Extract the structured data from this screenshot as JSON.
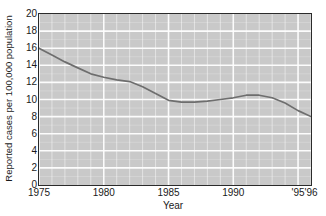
{
  "chart_data": {
    "type": "line",
    "title": "",
    "xlabel": "Year",
    "ylabel": "Reported cases per 100,000 population",
    "xlim": [
      1975,
      1996
    ],
    "ylim": [
      0,
      20
    ],
    "ytick_step": 2,
    "yticks": [
      "20",
      "18",
      "16",
      "14",
      "12",
      "10",
      "8",
      "6",
      "4",
      "2",
      "0"
    ],
    "ytick_values": [
      20,
      18,
      16,
      14,
      12,
      10,
      8,
      6,
      4,
      2,
      0
    ],
    "xticks": [
      {
        "label": "1975",
        "value": 1975
      },
      {
        "label": "1980",
        "value": 1980
      },
      {
        "label": "1985",
        "value": 1985
      },
      {
        "label": "1990",
        "value": 1990
      },
      {
        "label": "'95",
        "value": 1995
      },
      {
        "label": "'96",
        "value": 1996
      }
    ],
    "grid": "both-axes-white-minor-and-major",
    "legend": "none",
    "x": [
      1975,
      1976,
      1977,
      1978,
      1979,
      1980,
      1981,
      1982,
      1983,
      1984,
      1985,
      1986,
      1987,
      1988,
      1989,
      1990,
      1991,
      1992,
      1993,
      1994,
      1995,
      1996
    ],
    "series": [
      {
        "name": "Reported cases per 100,000 population",
        "color": "#6e6e6e",
        "values": [
          16.0,
          15.2,
          14.4,
          13.7,
          13.0,
          12.6,
          12.3,
          12.1,
          11.5,
          10.7,
          9.9,
          9.7,
          9.7,
          9.8,
          10.0,
          10.2,
          10.5,
          10.5,
          10.2,
          9.6,
          8.7,
          8.0
        ]
      }
    ]
  },
  "colors": {
    "plot_background": "#c9c9c9",
    "gridline": "#ffffff",
    "axis_frame": "#2b2b2b",
    "line": "#6e6e6e",
    "text": "#1a1a1a",
    "page_background": "#ffffff"
  }
}
